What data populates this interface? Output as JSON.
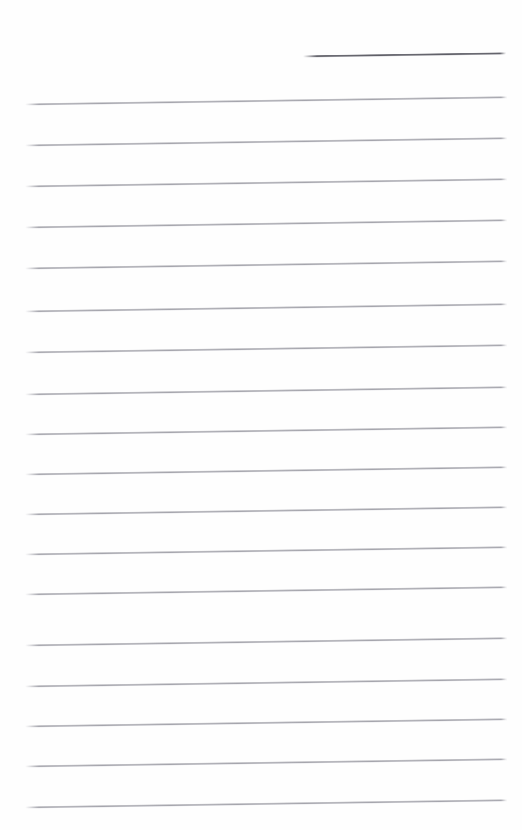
{
  "document": {
    "kind": "ruled-paper-scan",
    "title": "",
    "width": 522,
    "height": 830,
    "background_color": "#ffffff",
    "text_content": "",
    "is_blank": true
  },
  "ink": {
    "header_rule_color": "#5e5e66",
    "body_rule_color": "#a0a0a8",
    "paper_color": "#fefefe"
  },
  "geometry": {
    "skew_degrees": -0.85,
    "left_margin_x": 25,
    "right_margin_x": 507,
    "line_spacing": 40.5,
    "header_rule_indent_x": 303
  },
  "rules": [
    {
      "id": "header-rule",
      "kind": "header",
      "x": 303,
      "y": 56,
      "length": 203,
      "thickness": 3
    },
    {
      "id": "rule-1",
      "kind": "body",
      "x": 25,
      "y": 104,
      "length": 482,
      "thickness": 3
    },
    {
      "id": "rule-2",
      "kind": "body",
      "x": 25,
      "y": 145,
      "length": 482,
      "thickness": 3
    },
    {
      "id": "rule-3",
      "kind": "body",
      "x": 25,
      "y": 186,
      "length": 482,
      "thickness": 3
    },
    {
      "id": "rule-4",
      "kind": "body",
      "x": 25,
      "y": 227,
      "length": 482,
      "thickness": 3
    },
    {
      "id": "rule-5",
      "kind": "body",
      "x": 25,
      "y": 268,
      "length": 482,
      "thickness": 3
    },
    {
      "id": "rule-6",
      "kind": "body",
      "x": 25,
      "y": 311,
      "length": 482,
      "thickness": 3
    },
    {
      "id": "rule-7",
      "kind": "body",
      "x": 25,
      "y": 352,
      "length": 482,
      "thickness": 3
    },
    {
      "id": "rule-8",
      "kind": "body",
      "x": 25,
      "y": 394,
      "length": 482,
      "thickness": 3
    },
    {
      "id": "rule-9",
      "kind": "body",
      "x": 25,
      "y": 434,
      "length": 482,
      "thickness": 3
    },
    {
      "id": "rule-10",
      "kind": "body",
      "x": 25,
      "y": 474,
      "length": 482,
      "thickness": 3
    },
    {
      "id": "rule-11",
      "kind": "body",
      "x": 25,
      "y": 514,
      "length": 482,
      "thickness": 3
    },
    {
      "id": "rule-12",
      "kind": "body",
      "x": 25,
      "y": 554,
      "length": 482,
      "thickness": 3
    },
    {
      "id": "rule-13",
      "kind": "body",
      "x": 25,
      "y": 594,
      "length": 482,
      "thickness": 3
    },
    {
      "id": "rule-14",
      "kind": "body",
      "x": 25,
      "y": 645,
      "length": 482,
      "thickness": 3
    },
    {
      "id": "rule-15",
      "kind": "body",
      "x": 25,
      "y": 686,
      "length": 482,
      "thickness": 3
    },
    {
      "id": "rule-16",
      "kind": "body",
      "x": 25,
      "y": 726,
      "length": 482,
      "thickness": 3
    },
    {
      "id": "rule-17",
      "kind": "body",
      "x": 25,
      "y": 766,
      "length": 482,
      "thickness": 3
    },
    {
      "id": "rule-18",
      "kind": "body",
      "x": 25,
      "y": 807,
      "length": 482,
      "thickness": 3
    }
  ]
}
